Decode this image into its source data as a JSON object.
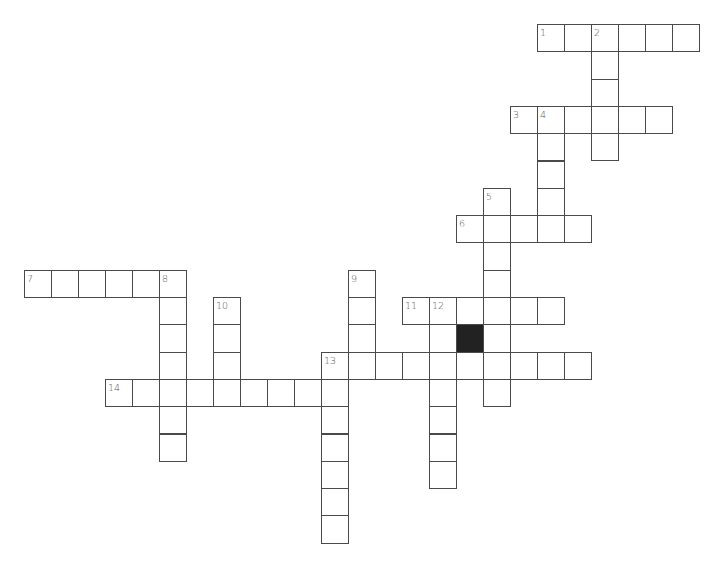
{
  "puzzle": {
    "type": "crossword",
    "layout": {
      "origin_x": 24,
      "origin_y": 24,
      "cell_w": 27,
      "cell_h": 27.3
    },
    "colors": {
      "border": "#4a4a4a",
      "block": "#222222",
      "number": "#555555",
      "background": "#ffffff"
    },
    "entries": [
      {
        "number": 1,
        "direction": "across",
        "row": 0,
        "col": 19,
        "length": 6
      },
      {
        "number": 2,
        "direction": "down",
        "row": 0,
        "col": 21,
        "length": 5
      },
      {
        "number": 3,
        "direction": "across",
        "row": 3,
        "col": 18,
        "length": 6
      },
      {
        "number": 4,
        "direction": "down",
        "row": 3,
        "col": 19,
        "length": 5
      },
      {
        "number": 5,
        "direction": "down",
        "row": 6,
        "col": 17,
        "length": 8
      },
      {
        "number": 6,
        "direction": "across",
        "row": 7,
        "col": 16,
        "length": 5
      },
      {
        "number": 7,
        "direction": "across",
        "row": 9,
        "col": 0,
        "length": 6
      },
      {
        "number": 8,
        "direction": "down",
        "row": 9,
        "col": 5,
        "length": 7
      },
      {
        "number": 9,
        "direction": "down",
        "row": 9,
        "col": 12,
        "length": 4
      },
      {
        "number": 10,
        "direction": "down",
        "row": 10,
        "col": 7,
        "length": 4
      },
      {
        "number": 11,
        "direction": "across",
        "row": 10,
        "col": 14,
        "length": 6
      },
      {
        "number": 12,
        "direction": "down",
        "row": 10,
        "col": 15,
        "length": 7
      },
      {
        "number": 13,
        "direction": "across",
        "row": 12,
        "col": 11,
        "length": 10
      },
      {
        "number": 13,
        "direction": "down",
        "row": 12,
        "col": 11,
        "length": 7
      },
      {
        "number": 14,
        "direction": "across",
        "row": 13,
        "col": 3,
        "length": 9
      }
    ],
    "black_cells": [
      {
        "row": 11,
        "col": 16
      }
    ]
  }
}
